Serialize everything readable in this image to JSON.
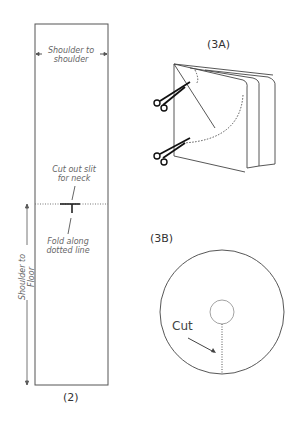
{
  "figure2": {
    "caption": "(2)",
    "width_label_line1": "Shoulder to",
    "width_label_line2": "shoulder",
    "slit_label_line1": "Cut out slit",
    "slit_label_line2": "for neck",
    "fold_label_line1": "Fold along",
    "fold_label_line2": "dotted line",
    "height_label_line1": "Shoulder to",
    "height_label_line2": "Floor"
  },
  "figure3a": {
    "caption": "(3A)",
    "icons": [
      "scissors-icon",
      "scissors-icon"
    ]
  },
  "figure3b": {
    "caption": "(3B)",
    "cut_label": "Cut"
  }
}
